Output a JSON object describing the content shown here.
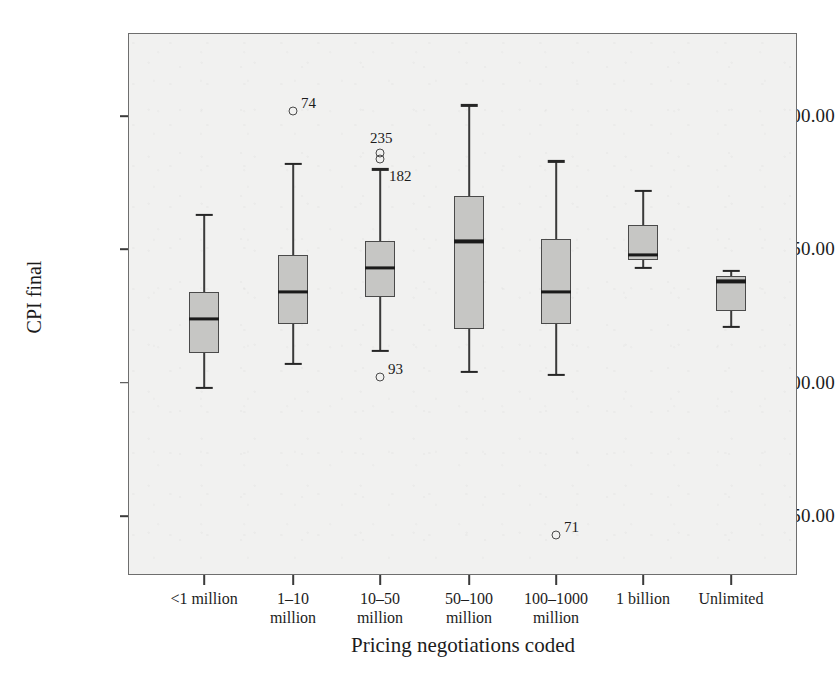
{
  "chart_data": {
    "type": "box",
    "title": "",
    "xlabel": "Pricing negotiations coded",
    "ylabel": "CPI final",
    "ylim": [
      233,
      428
    ],
    "yticks": [
      {
        "value": 250,
        "label": "250.00"
      },
      {
        "value": 300,
        "label": "300.00"
      },
      {
        "value": 350,
        "label": "350.00"
      },
      {
        "value": 400,
        "label": "400.00"
      }
    ],
    "grid": false,
    "legend": "none",
    "categories": [
      "<1 million",
      "1–10\nmillion",
      "10–50\nmillion",
      "50–100\nmillion",
      "100–1000\nmillion",
      "1 billion",
      "Unlimited"
    ],
    "boxes": [
      {
        "category": "<1 million",
        "whisker_low": 298.0,
        "q1": 311.0,
        "median": 324.0,
        "q3": 334.0,
        "whisker_high": 363.0,
        "outliers": []
      },
      {
        "category": "1–10 million",
        "whisker_low": 307.0,
        "q1": 322.0,
        "median": 334.0,
        "q3": 348.0,
        "whisker_high": 382.0,
        "outliers": [
          {
            "label": "74",
            "value": 402.0
          }
        ]
      },
      {
        "category": "10–50 million",
        "whisker_low": 312.0,
        "q1": 332.0,
        "median": 343.0,
        "q3": 353.0,
        "whisker_high": 380.0,
        "outliers": [
          {
            "label": "235",
            "value": 386.0
          },
          {
            "label": "182",
            "value": 384.0
          },
          {
            "label": "93",
            "value": 302.0
          }
        ]
      },
      {
        "category": "50–100 million",
        "whisker_low": 304.0,
        "q1": 320.0,
        "median": 353.0,
        "q3": 370.0,
        "whisker_high": 404.0,
        "outliers": []
      },
      {
        "category": "100–1000 million",
        "whisker_low": 303.0,
        "q1": 322.0,
        "median": 334.0,
        "q3": 354.0,
        "whisker_high": 383.0,
        "outliers": [
          {
            "label": "71",
            "value": 243.0
          }
        ]
      },
      {
        "category": "1 billion",
        "whisker_low": 343.0,
        "q1": 346.0,
        "median": 348.0,
        "q3": 359.0,
        "whisker_high": 372.0,
        "outliers": []
      },
      {
        "category": "Unlimited",
        "whisker_low": 321.0,
        "q1": 327.0,
        "median": 338.0,
        "q3": 340.0,
        "whisker_high": 342.0,
        "outliers": []
      }
    ],
    "colors": {
      "box_fill": "#c6c6c4",
      "box_stroke": "#4a4a4a",
      "median": "#1a1a1a",
      "whisker": "#3a3a3a",
      "plot_background": "#f1f1f0",
      "frame": "#6e6e6e",
      "text": "#1c1c1c"
    }
  }
}
